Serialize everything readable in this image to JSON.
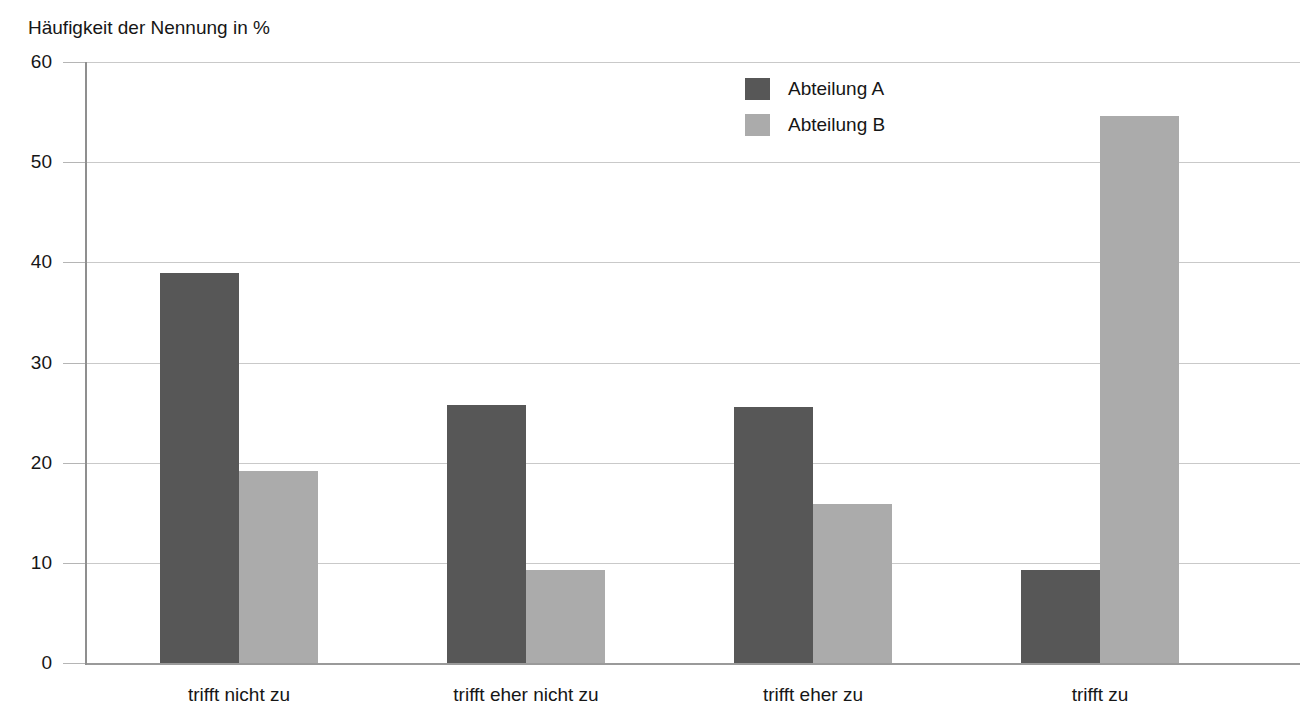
{
  "chart_data": {
    "type": "bar",
    "title": "",
    "xlabel": "",
    "ylabel": "Häufigkeit der Nennung in %",
    "ylim": [
      0,
      60
    ],
    "ytick_step": 10,
    "yticks": [
      0,
      10,
      20,
      30,
      40,
      50,
      60
    ],
    "ytick_labels": [
      "0",
      "10",
      "20",
      "30",
      "40",
      "50",
      "60"
    ],
    "grid": true,
    "grid_axis": "y",
    "legend_position": "top-right",
    "categories": [
      "trifft nicht zu",
      "trifft eher nicht zu",
      "trifft eher zu",
      "trifft zu"
    ],
    "series": [
      {
        "name": "Abteilung A",
        "color": "#575757",
        "values": [
          38.9,
          25.8,
          25.6,
          9.3
        ]
      },
      {
        "name": "Abteilung B",
        "color": "#ababab",
        "values": [
          19.2,
          9.3,
          15.9,
          54.6
        ]
      }
    ]
  },
  "axis": {
    "y_title": "Häufigkeit der Nennung in %"
  },
  "legend": {
    "entries": [
      {
        "label": "Abteilung A",
        "color": "#575757"
      },
      {
        "label": "Abteilung B",
        "color": "#ababab"
      }
    ]
  }
}
